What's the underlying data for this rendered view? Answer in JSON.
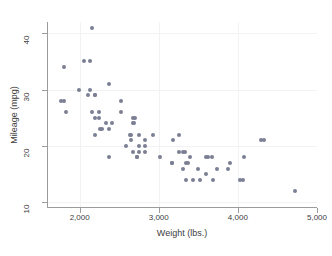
{
  "chart_data": {
    "type": "scatter",
    "title": "",
    "xlabel": "Weight (lbs.)",
    "ylabel": "Mileage (mpg)",
    "xlim": [
      1600,
      5000
    ],
    "ylim": [
      9,
      42
    ],
    "xticks": [
      2000,
      3000,
      4000,
      5000
    ],
    "xtick_labels": [
      "2,000",
      "3,000",
      "4,000",
      "5,000"
    ],
    "yticks": [
      10,
      20,
      30,
      40
    ],
    "ytick_labels": [
      "10",
      "20",
      "30",
      "40"
    ],
    "grid": true,
    "legend": "none",
    "marker_color": "#7b7f93",
    "axis_color": "#9b9b9b",
    "background": "#ffffff",
    "n_points": 74,
    "series": [
      {
        "name": "Mileage vs Weight",
        "x": [
          2930,
          3350,
          2640,
          3250,
          4080,
          3670,
          3880,
          3400,
          3015,
          4030,
          3180,
          4060,
          3300,
          3690,
          3490,
          3525,
          3300,
          4330,
          3900,
          4290,
          2110,
          2200,
          2520,
          2330,
          3370,
          2730,
          2830,
          2580,
          3350,
          3620,
          2050,
          2410,
          2200,
          2280,
          2750,
          3430,
          3260,
          3600,
          2700,
          2750,
          2240,
          2520,
          2650,
          2130,
          2190,
          2670,
          4720,
          3740,
          1800,
          1990,
          3600,
          3330,
          2260,
          1800,
          2240,
          2750,
          2370,
          2130,
          2650,
          1760,
          2730,
          2690,
          3170,
          2160,
          2670,
          1830,
          2370,
          2200,
          2670,
          2160,
          2370,
          2830,
          3170,
          2830
        ],
        "y": [
          22,
          17,
          22,
          22,
          18,
          18,
          16,
          18,
          18,
          14,
          21,
          14,
          16,
          14,
          16,
          14,
          19,
          21,
          17,
          21,
          29,
          29,
          28,
          24,
          17,
          18,
          21,
          20,
          14,
          18,
          35,
          24,
          25,
          23,
          19,
          14,
          19,
          15,
          25,
          22,
          26,
          26,
          21,
          30,
          29,
          24,
          12,
          16,
          34,
          30,
          18,
          19,
          23,
          28,
          25,
          20,
          18,
          35,
          22,
          28,
          18,
          24,
          17,
          41,
          25,
          26,
          31,
          22,
          19,
          26,
          23,
          19,
          17,
          20
        ]
      }
    ],
    "annotations": []
  },
  "axes": {
    "y_title": "Mileage (mpg)",
    "x_title": "Weight (lbs.)"
  }
}
